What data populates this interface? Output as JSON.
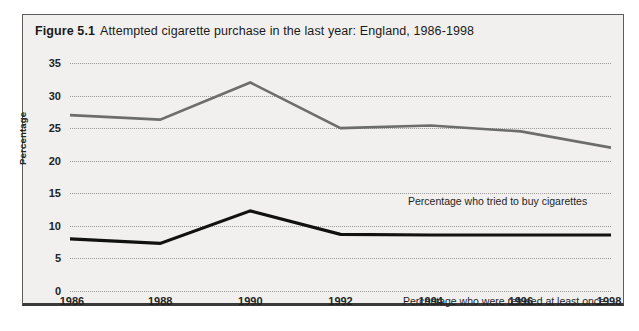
{
  "figure": {
    "number_label": "Figure 5.1",
    "title": "Attempted cigarette purchase in the last year: England, 1986-1998"
  },
  "chart_data": {
    "type": "line",
    "title": "Attempted cigarette purchase in the last year: England, 1986-1998",
    "xlabel": "",
    "ylabel": "Percentage",
    "x": [
      1986,
      1988,
      1990,
      1992,
      1994,
      1996,
      1998
    ],
    "xtick_labels": [
      "1986",
      "1988",
      "1990",
      "1992",
      "1994",
      "1996",
      "1998"
    ],
    "ytick_labels": [
      "0",
      "5",
      "10",
      "15",
      "20",
      "25",
      "30",
      "35"
    ],
    "yticks": [
      0,
      5,
      10,
      15,
      20,
      25,
      30,
      35
    ],
    "ylim": [
      0,
      35
    ],
    "xlim": [
      1986,
      1998
    ],
    "grid": "horizontal-dotted",
    "legend": "inline-annotations",
    "series": [
      {
        "name": "Percentage who tried to buy cigarettes",
        "color": "#6d6d6d",
        "width": 2.6,
        "values": [
          27.0,
          26.3,
          32.0,
          25.0,
          25.4,
          24.5,
          22.0
        ]
      },
      {
        "name": "Percentage who were refused at least once",
        "color": "#111111",
        "width": 3.2,
        "values": [
          8.0,
          7.3,
          12.3,
          8.7,
          8.6,
          8.6,
          8.6
        ]
      }
    ],
    "annotations": [
      {
        "text": "Percentage who tried to buy cigarettes",
        "x": 1992,
        "y": 23.2
      },
      {
        "text": "Percentage who were refused at least once",
        "x": 1992.2,
        "y": 7.3
      }
    ]
  },
  "colors": {
    "panel_background": "#f1f0ee",
    "panel_border": "#5d5d5d",
    "gridline": "#9a9a9a",
    "text": "#1a1a1a",
    "series_tried": "#6d6d6d",
    "series_refused": "#111111"
  }
}
